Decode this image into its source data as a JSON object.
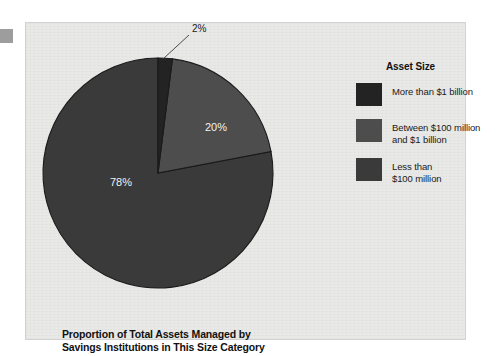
{
  "chart_data": {
    "type": "pie",
    "title": "Proportion of Total Assets Managed by Savings Institutions in This Size Category",
    "title_line1": "Proportion of Total Assets Managed by",
    "title_line2": "Savings Institutions in This Size Category",
    "legend_title": "Asset Size",
    "legend_position": "right",
    "grid": false,
    "start_angle_deg": 0,
    "direction": "clockwise",
    "categories": [
      "More than $1 billion",
      "Between $100 million and $1 billion",
      "Less than $100 million"
    ],
    "values": [
      2,
      20,
      78
    ],
    "value_labels": [
      "2%",
      "20%",
      "78%"
    ],
    "colors": [
      "#232323",
      "#4d4d4d",
      "#3a3a3a"
    ],
    "slices": [
      {
        "label": "More than $1 billion",
        "legend_line1": "More than $1 billion",
        "legend_line2": "",
        "value": 2,
        "value_label": "2%",
        "color": "#232323",
        "label_placement": "outside-callout"
      },
      {
        "label": "Between $100 million and $1 billion",
        "legend_line1": "Between $100 million",
        "legend_line2": "and $1 billion",
        "value": 20,
        "value_label": "20%",
        "color": "#4d4d4d",
        "label_placement": "inside"
      },
      {
        "label": "Less than $100 million",
        "legend_line1": "Less than",
        "legend_line2": "$100 million",
        "value": 78,
        "value_label": "78%",
        "color": "#3a3a3a",
        "label_placement": "inside"
      }
    ]
  },
  "panel": {
    "background_color": "#e9e9e7",
    "border_color": "#d2d2d0"
  }
}
